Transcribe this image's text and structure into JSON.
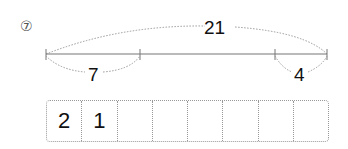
{
  "question_number": "⑦",
  "diagram": {
    "total_label": "21",
    "left_segment_label": "7",
    "right_segment_label": "4"
  },
  "answer_boxes": {
    "cells": [
      "2",
      "1",
      "",
      "",
      "",
      "",
      "",
      ""
    ]
  }
}
